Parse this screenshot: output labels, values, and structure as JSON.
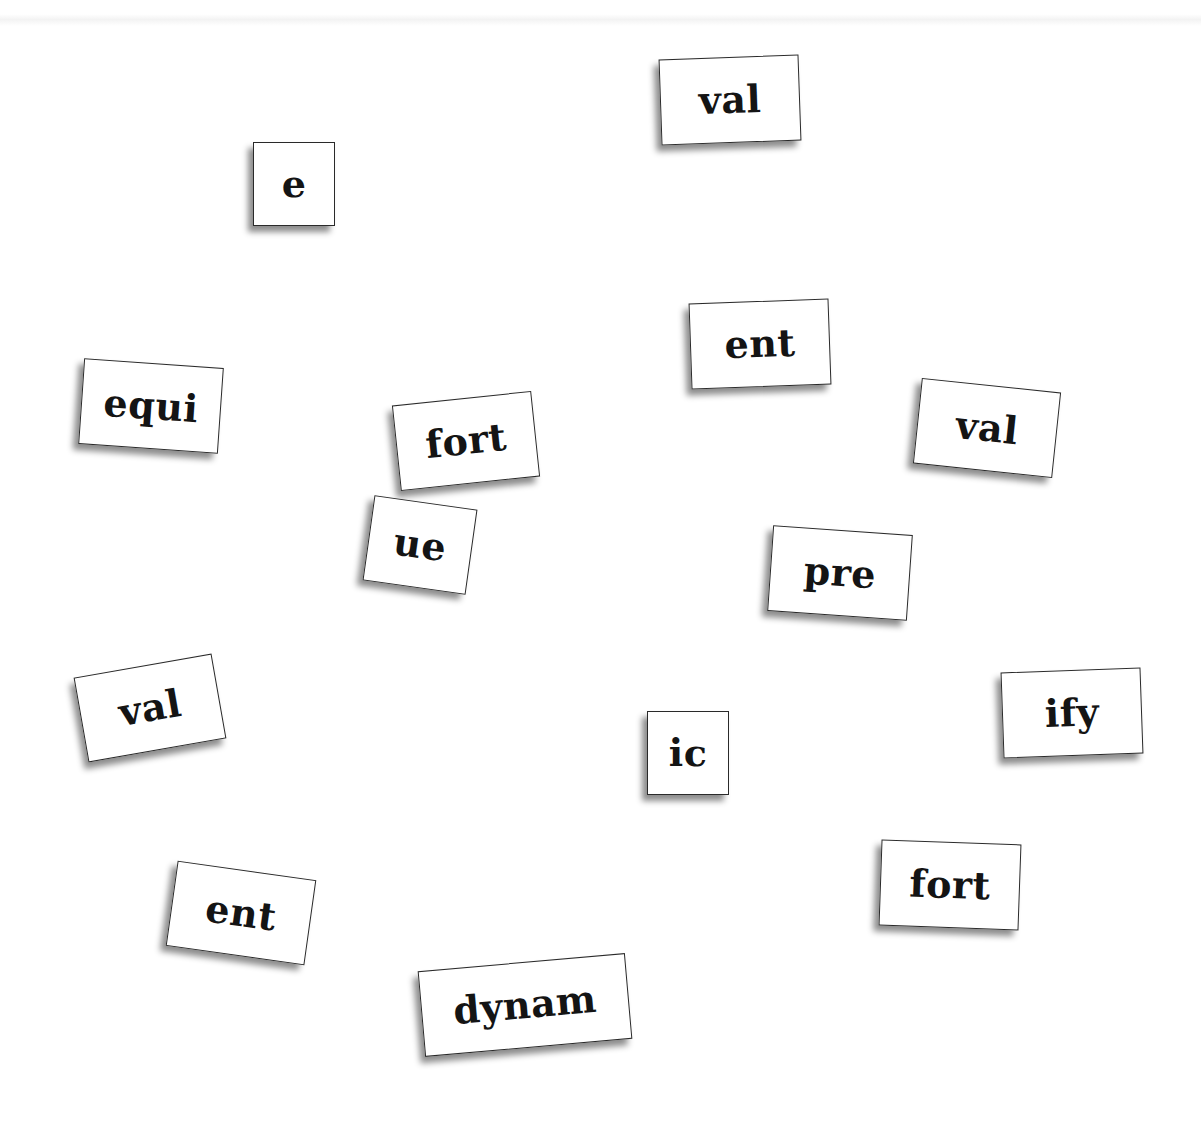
{
  "canvas": {
    "background": "#ffffff"
  },
  "tiles": [
    {
      "id": "val-1",
      "text": "val"
    },
    {
      "id": "e",
      "text": "e"
    },
    {
      "id": "ent-1",
      "text": "ent"
    },
    {
      "id": "equi",
      "text": "equi"
    },
    {
      "id": "fort-1",
      "text": "fort"
    },
    {
      "id": "val-2",
      "text": "val"
    },
    {
      "id": "ue",
      "text": "ue"
    },
    {
      "id": "pre",
      "text": "pre"
    },
    {
      "id": "val-3",
      "text": "val"
    },
    {
      "id": "ify",
      "text": "ify"
    },
    {
      "id": "ic",
      "text": "ic"
    },
    {
      "id": "ent-2",
      "text": "ent"
    },
    {
      "id": "fort-2",
      "text": "fort"
    },
    {
      "id": "dynam",
      "text": "dynam"
    }
  ]
}
